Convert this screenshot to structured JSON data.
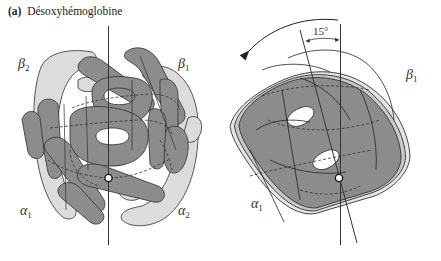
{
  "figure": {
    "panel_label": "(a)",
    "title": "Désoxyhémoglobine",
    "left_structure": {
      "labels": {
        "beta2": {
          "symbol": "β",
          "sub": "2"
        },
        "beta1": {
          "symbol": "β",
          "sub": "1"
        },
        "alpha1": {
          "symbol": "α",
          "sub": "1"
        },
        "alpha2": {
          "symbol": "α",
          "sub": "2"
        }
      }
    },
    "right_structure": {
      "rotation_label": "15°",
      "labels": {
        "beta1": {
          "symbol": "β",
          "sub": "1"
        },
        "alpha1": {
          "symbol": "α",
          "sub": "1"
        }
      }
    },
    "colors": {
      "dark_subunit": "#8c8c8c",
      "light_subunit": "#dcdcdc",
      "outline": "#2f2f2f",
      "axis": "#333333"
    }
  }
}
